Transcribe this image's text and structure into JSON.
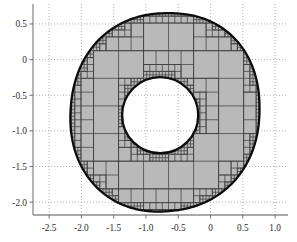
{
  "figure": {
    "title": "",
    "background": "#ffffff",
    "width": 297,
    "height": 242
  },
  "chart_data": {
    "type": "scatter",
    "title": "",
    "subtitle": "",
    "xlabel": "",
    "ylabel": "",
    "xlim": [
      -2.75,
      1.2
    ],
    "ylim": [
      -2.18,
      0.78
    ],
    "xticks": [
      -2.5,
      -2.0,
      -1.5,
      -1.0,
      -0.5,
      0,
      0.5,
      1.0
    ],
    "xtick_labels": [
      "-2.5",
      "-2.0",
      "-1.5",
      "-1.0",
      "-0.5",
      "0",
      "0.5",
      "1.0"
    ],
    "yticks": [
      0.5,
      0,
      -0.5,
      -1.0,
      -1.5,
      -2.0
    ],
    "ytick_labels": [
      "0.5",
      "0",
      "-0.5",
      "-1.0",
      "-1.5",
      "-2.0"
    ],
    "grid": true,
    "grid_style": "dotted",
    "grid_color": "#9a9a9a",
    "legend": null,
    "axis_color": "#8c8c8c",
    "series": [
      {
        "name": "quadtree-mesh-cells",
        "type": "mesh",
        "fill_color": "#b9b9b9",
        "edge_color": "#3a3a3a",
        "description": "adaptive quadtree cells covering the annular domain"
      },
      {
        "name": "outer-boundary",
        "type": "closed-curve",
        "color": "#101010",
        "line_width": 2.2,
        "x_range": [
          -2.09,
          0.8
        ],
        "y_range": [
          -2.09,
          0.72
        ]
      },
      {
        "name": "inner-boundary",
        "type": "circle",
        "color": "#101010",
        "line_width": 2.2,
        "center": [
          -0.78,
          -0.78
        ],
        "radius": 0.56
      }
    ]
  },
  "axes": {
    "x_axis_name": "x-axis",
    "y_axis_name": "y-axis"
  }
}
